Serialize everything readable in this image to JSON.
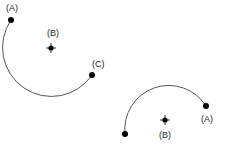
{
  "figures": [
    {
      "name": "arc-figure-1",
      "arc": {
        "start": [
          11,
          20
        ],
        "end": [
          92,
          75
        ],
        "radius": 43,
        "large_arc": 1,
        "sweep": 0
      },
      "points": [
        {
          "id": "A",
          "label": "(A)",
          "x": 11,
          "y": 20,
          "lx": 6,
          "ly": 11,
          "kind": "endpoint"
        },
        {
          "id": "B",
          "label": "(B)",
          "x": 51,
          "y": 48,
          "lx": 47,
          "ly": 36,
          "kind": "center"
        },
        {
          "id": "C",
          "label": "(C)",
          "x": 92,
          "y": 75,
          "lx": 92,
          "ly": 67,
          "kind": "endpoint"
        }
      ]
    },
    {
      "name": "arc-figure-2",
      "arc": {
        "start": [
          206,
          106
        ],
        "end": [
          125,
          134
        ],
        "radius": 44,
        "large_arc": 0,
        "sweep": 0
      },
      "points": [
        {
          "id": "A",
          "label": "(A)",
          "x": 206,
          "y": 106,
          "lx": 201,
          "ly": 122,
          "kind": "endpoint"
        },
        {
          "id": "B",
          "label": "(B)",
          "x": 165,
          "y": 120,
          "lx": 159,
          "ly": 138,
          "kind": "center"
        },
        {
          "id": "",
          "label": "",
          "x": 125,
          "y": 134,
          "lx": 0,
          "ly": 0,
          "kind": "endpoint"
        }
      ]
    }
  ]
}
